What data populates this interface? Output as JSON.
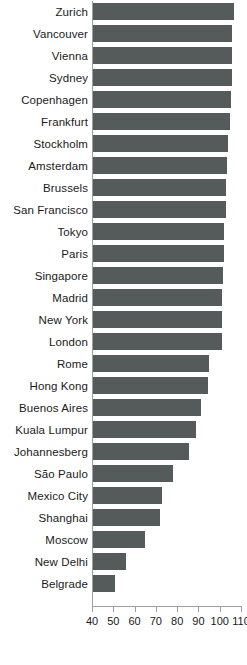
{
  "chart_data": {
    "type": "bar",
    "orientation": "horizontal",
    "title": "",
    "subtitle": "",
    "xlabel": "",
    "ylabel": "",
    "xlim": [
      40,
      110
    ],
    "grid": false,
    "legend": false,
    "bar_color": "#555a5a",
    "axis_color": "#9aa0a0",
    "text_color": "#1a1a1a",
    "xticks": [
      40,
      50,
      60,
      70,
      80,
      90,
      100,
      110
    ],
    "xtick_labels": [
      "40",
      "50",
      "60",
      "70",
      "80",
      "90",
      "100",
      "110"
    ],
    "categories": [
      "Zurich",
      "Vancouver",
      "Vienna",
      "Sydney",
      "Copenhagen",
      "Frankfurt",
      "Stockholm",
      "Amsterdam",
      "Brussels",
      "San Francisco",
      "Tokyo",
      "Paris",
      "Singapore",
      "Madrid",
      "New York",
      "London",
      "Rome",
      "Hong Kong",
      "Buenos Aires",
      "Kuala Lumpur",
      "Johannesberg",
      "São Paulo",
      "Mexico City",
      "Shanghai",
      "Moscow",
      "New Delhi",
      "Belgrade"
    ],
    "values": [
      106.5,
      106.0,
      106.0,
      106.0,
      105.5,
      105.0,
      104.0,
      103.5,
      103.0,
      103.0,
      102.0,
      102.0,
      101.5,
      101.0,
      101.0,
      101.0,
      95.0,
      94.5,
      91.0,
      89.0,
      85.5,
      78.0,
      73.0,
      72.0,
      65.0,
      56.0,
      51.0
    ]
  }
}
